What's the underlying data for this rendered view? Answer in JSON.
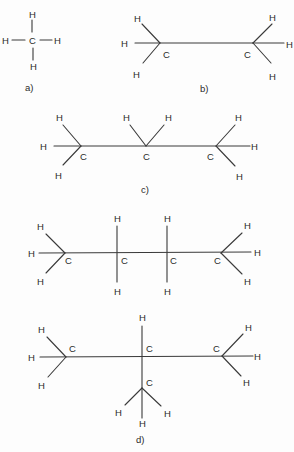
{
  "figure": {
    "molecules": [
      {
        "id": "a",
        "label": "a)",
        "name": "methane",
        "carbon_symbol": "C",
        "hydrogen_symbol": "H",
        "atoms": {
          "c": "C",
          "h_top": "H",
          "h_left": "H",
          "h_right": "H",
          "h_bottom": "H"
        }
      },
      {
        "id": "b",
        "label": "b)",
        "name": "ethane",
        "atoms": {
          "c1": "C",
          "c2": "C",
          "h1": "H",
          "h2": "H",
          "h3": "H",
          "h4": "H",
          "h5": "H",
          "h6": "H"
        }
      },
      {
        "id": "c",
        "label": "c)",
        "name": "propane",
        "atoms": {
          "c1": "C",
          "c2": "C",
          "c3": "C",
          "h1": "H",
          "h2": "H",
          "h3": "H",
          "h4": "H",
          "h5": "H",
          "h6": "H",
          "h7": "H",
          "h8": "H"
        }
      },
      {
        "id": "d1",
        "label": "",
        "name": "n-butane",
        "atoms": {
          "c1": "C",
          "c2": "C",
          "c3": "C",
          "c4": "C",
          "h1": "H",
          "h2": "H",
          "h3": "H",
          "h4": "H",
          "h5": "H",
          "h6": "H",
          "h7": "H",
          "h8": "H",
          "h9": "H",
          "h10": "H"
        }
      },
      {
        "id": "d2",
        "label": "d)",
        "name": "isobutane",
        "atoms": {
          "c1": "C",
          "c2": "C",
          "c3": "C",
          "c4": "C",
          "h1": "H",
          "h2": "H",
          "h3": "H",
          "h4": "H",
          "h5": "H",
          "h6": "H",
          "h7": "H",
          "h8": "H",
          "h9": "H",
          "h10": "H"
        }
      }
    ],
    "colors": {
      "ink": "#2a2a2a",
      "background": "#fdfdfd"
    }
  }
}
